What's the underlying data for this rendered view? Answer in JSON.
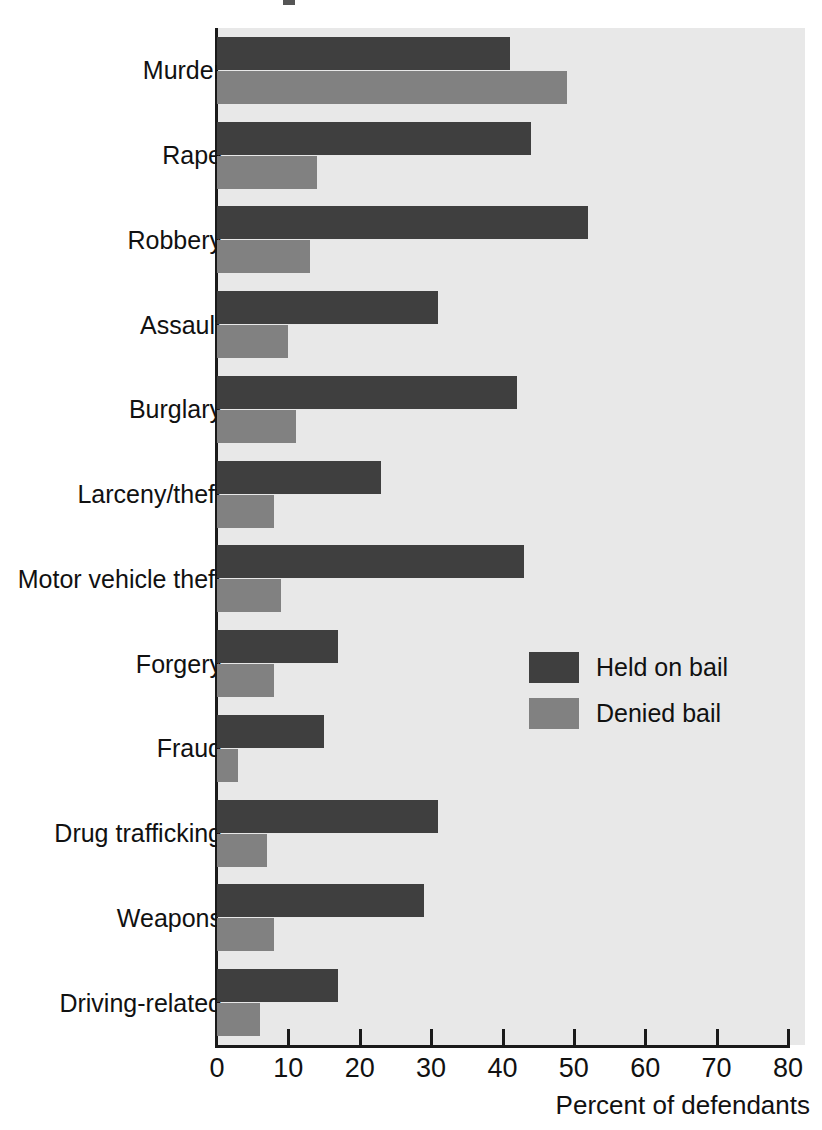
{
  "chart_data": {
    "type": "bar",
    "orientation": "horizontal",
    "title": "",
    "xlabel": "Percent of defendants",
    "ylabel": "",
    "xlim": [
      0,
      80
    ],
    "xticks": [
      0,
      10,
      20,
      30,
      40,
      50,
      60,
      70,
      80
    ],
    "xtick_labels": [
      "0",
      "10",
      "20",
      "30",
      "40",
      "50",
      "60",
      "70",
      "80"
    ],
    "grid": false,
    "legend_position": "center-right",
    "categories": [
      "Murder",
      "Rape",
      "Robbery",
      "Assault",
      "Burglary",
      "Larceny/theft",
      "Motor vehicle theft",
      "Forgery",
      "Fraud",
      "Drug trafficking",
      "Weapons",
      "Driving-related"
    ],
    "series": [
      {
        "name": "Held on bail",
        "color": "#3f3f3f",
        "values": [
          41,
          44,
          52,
          31,
          42,
          23,
          43,
          17,
          15,
          31,
          29,
          17
        ]
      },
      {
        "name": "Denied bail",
        "color": "#818181",
        "values": [
          49,
          14,
          13,
          10,
          11,
          8,
          9,
          8,
          3,
          7,
          8,
          6
        ]
      }
    ]
  },
  "legend": {
    "entries": [
      {
        "label": "Held on bail",
        "swatch": "dark-gray-swatch"
      },
      {
        "label": "Denied bail",
        "swatch": "medium-gray-swatch"
      }
    ]
  },
  "colors": {
    "held_on_bail": "#3f3f3f",
    "denied_bail": "#818181",
    "plot_background": "#e8e8e8",
    "axis": "#1a1a1a",
    "page_background": "#ffffff"
  }
}
